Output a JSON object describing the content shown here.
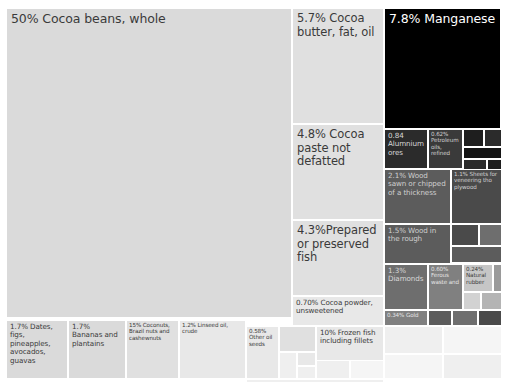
{
  "chart_data": {
    "type": "treemap",
    "title": "",
    "value_unit": "percent share",
    "background": "#ffffff",
    "gap_color": "#ffffff",
    "nodes": [
      {
        "name": "cocoa-beans-whole",
        "label": "50% Cocoa beans, whole",
        "value": 50,
        "x": 6,
        "y": 8,
        "w": 286,
        "h": 310,
        "tone": 13,
        "size": "xl"
      },
      {
        "name": "cocoa-butter-fat-oil",
        "label": "5.7% Cocoa butter, fat, oil",
        "value": 5.7,
        "x": 292,
        "y": 8,
        "w": 92,
        "h": 116,
        "tone": 14,
        "size": "lg"
      },
      {
        "name": "manganese",
        "label": "7.8% Manganese",
        "value": 7.8,
        "x": 384,
        "y": 8,
        "w": 117,
        "h": 121,
        "tone": 0,
        "size": "xl"
      },
      {
        "name": "cocoa-paste-not-defatted",
        "label": "4.8% Cocoa paste not defatted",
        "value": 4.8,
        "x": 292,
        "y": 124,
        "w": 92,
        "h": 96,
        "tone": 14,
        "size": "lg"
      },
      {
        "name": "prepared-or-preserved-fish",
        "label": "4.3%Prepared or preserved fish",
        "value": 4.3,
        "x": 292,
        "y": 220,
        "w": 92,
        "h": 76,
        "tone": 14,
        "size": "lg"
      },
      {
        "name": "cocoa-powder-unsweetened",
        "label": "0.70% Cocoa powder, unsweetened",
        "value": 0.7,
        "x": 292,
        "y": 296,
        "w": 92,
        "h": 30,
        "tone": 15,
        "size": "sm"
      },
      {
        "name": "aluminium-ores",
        "label": "0.84 Alumnium ores",
        "value": 0.84,
        "x": 384,
        "y": 129,
        "w": 44,
        "h": 40,
        "tone": 3,
        "size": "sm"
      },
      {
        "name": "petroleum-oils-refined",
        "label": "0.62% Petroleum oils, refined",
        "value": 0.62,
        "x": 428,
        "y": 129,
        "w": 35,
        "h": 40,
        "tone": 4,
        "size": "xs"
      },
      {
        "name": "small-dark-cell-a",
        "label": "",
        "value": 0.3,
        "x": 463,
        "y": 129,
        "w": 21,
        "h": 18,
        "tone": 2,
        "size": "xs"
      },
      {
        "name": "small-dark-cell-b",
        "label": "",
        "value": 0.28,
        "x": 484,
        "y": 129,
        "w": 18,
        "h": 18,
        "tone": 3,
        "size": "xs"
      },
      {
        "name": "small-dark-cell-c",
        "label": "",
        "value": 0.22,
        "x": 463,
        "y": 147,
        "w": 39,
        "h": 12,
        "tone": 1,
        "size": "xs"
      },
      {
        "name": "small-dark-cell-d",
        "label": "",
        "value": 0.18,
        "x": 463,
        "y": 159,
        "w": 24,
        "h": 11,
        "tone": 3,
        "size": "xs"
      },
      {
        "name": "small-dark-cell-e",
        "label": "",
        "value": 0.14,
        "x": 487,
        "y": 159,
        "w": 15,
        "h": 11,
        "tone": 2,
        "size": "xs"
      },
      {
        "name": "wood-sawn-or-chipped",
        "label": "2.1% Wood sawn or chipped of a thickness",
        "value": 2.1,
        "x": 384,
        "y": 169,
        "w": 67,
        "h": 55,
        "tone": 6,
        "size": "sm"
      },
      {
        "name": "sheets-for-veneering",
        "label": "1.1% Sheets for veneering tho plywood",
        "value": 1.1,
        "x": 451,
        "y": 169,
        "w": 51,
        "h": 55,
        "tone": 5,
        "size": "xs"
      },
      {
        "name": "wood-in-the-rough",
        "label": "1.5% Wood in the rough",
        "value": 1.5,
        "x": 384,
        "y": 224,
        "w": 67,
        "h": 40,
        "tone": 6,
        "size": "sm"
      },
      {
        "name": "right-mid-cell-a",
        "label": "",
        "value": 0.5,
        "x": 451,
        "y": 224,
        "w": 28,
        "h": 22,
        "tone": 5,
        "size": "xs"
      },
      {
        "name": "right-mid-cell-b",
        "label": "",
        "value": 0.4,
        "x": 479,
        "y": 224,
        "w": 23,
        "h": 22,
        "tone": 7,
        "size": "xs"
      },
      {
        "name": "right-mid-cell-c",
        "label": "",
        "value": 0.3,
        "x": 451,
        "y": 246,
        "w": 51,
        "h": 17,
        "tone": 6,
        "size": "xs"
      },
      {
        "name": "diamonds",
        "label": "1.3% Diamonds",
        "value": 1.3,
        "x": 384,
        "y": 264,
        "w": 44,
        "h": 46,
        "tone": 7,
        "size": "sm"
      },
      {
        "name": "ferous-waste-and",
        "label": "0.60% Ferous waste and",
        "value": 0.6,
        "x": 428,
        "y": 264,
        "w": 35,
        "h": 46,
        "tone": 8,
        "size": "xs"
      },
      {
        "name": "natural-rubber",
        "label": "0.24% Natural rubber",
        "value": 0.24,
        "x": 463,
        "y": 264,
        "w": 30,
        "h": 28,
        "tone": 11,
        "size": "xs"
      },
      {
        "name": "right-low-cell-a",
        "label": "",
        "value": 0.15,
        "x": 493,
        "y": 264,
        "w": 9,
        "h": 28,
        "tone": 9,
        "size": "xs"
      },
      {
        "name": "right-low-cell-b",
        "label": "",
        "value": 0.12,
        "x": 463,
        "y": 292,
        "w": 18,
        "h": 18,
        "tone": 12,
        "size": "xs"
      },
      {
        "name": "right-low-cell-c",
        "label": "",
        "value": 0.1,
        "x": 481,
        "y": 292,
        "w": 21,
        "h": 18,
        "tone": 10,
        "size": "xs"
      },
      {
        "name": "gold",
        "label": "0.34% Gold",
        "value": 0.34,
        "x": 384,
        "y": 310,
        "w": 44,
        "h": 16,
        "tone": 8,
        "size": "xs"
      },
      {
        "name": "bottom-right-cell-a",
        "label": "",
        "value": 0.2,
        "x": 428,
        "y": 310,
        "w": 24,
        "h": 16,
        "tone": 6,
        "size": "xs"
      },
      {
        "name": "bottom-right-cell-b",
        "label": "",
        "value": 0.16,
        "x": 452,
        "y": 310,
        "w": 26,
        "h": 16,
        "tone": 7,
        "size": "xs"
      },
      {
        "name": "bottom-right-cell-c",
        "label": "",
        "value": 0.12,
        "x": 478,
        "y": 310,
        "w": 24,
        "h": 16,
        "tone": 5,
        "size": "xs"
      },
      {
        "name": "dates-figs-pineapples",
        "label": "1.7% Dates, figs, pineapples, avocados, guavas",
        "value": 1.7,
        "x": 6,
        "y": 320,
        "w": 62,
        "h": 59,
        "tone": 13,
        "size": "sm"
      },
      {
        "name": "bananas-and-plantains",
        "label": "1.7% Bananas and plantains",
        "value": 1.7,
        "x": 68,
        "y": 320,
        "w": 58,
        "h": 59,
        "tone": 13,
        "size": "sm"
      },
      {
        "name": "coconuts-brazil-cashew",
        "label": "15% Coconuts, Brazil nuts and cashewnuts",
        "value": 1.5,
        "x": 126,
        "y": 320,
        "w": 53,
        "h": 59,
        "tone": 14,
        "size": "xs"
      },
      {
        "name": "linseed-oil-crude",
        "label": "1.2% Linseed oil, crude",
        "value": 1.2,
        "x": 179,
        "y": 320,
        "w": 67,
        "h": 59,
        "tone": 15,
        "size": "xs"
      },
      {
        "name": "other-oil-seeds",
        "label": "0.58% Other oil seeds",
        "value": 0.58,
        "x": 246,
        "y": 326,
        "w": 33,
        "h": 53,
        "tone": 15,
        "size": "xs"
      },
      {
        "name": "frozen-fish-including-fillets",
        "label": "10% Frozen fish including fillets",
        "value": 1.0,
        "x": 316,
        "y": 326,
        "w": 68,
        "h": 53,
        "tone": 15,
        "size": "sm"
      },
      {
        "name": "bottom-filler-a",
        "label": "",
        "value": 0.3,
        "x": 279,
        "y": 326,
        "w": 37,
        "h": 26,
        "tone": 14,
        "size": "xs"
      },
      {
        "name": "bottom-filler-b",
        "label": "",
        "value": 0.2,
        "x": 279,
        "y": 352,
        "w": 18,
        "h": 27,
        "tone": 16,
        "size": "xs"
      },
      {
        "name": "bottom-filler-c",
        "label": "",
        "value": 0.18,
        "x": 297,
        "y": 352,
        "w": 19,
        "h": 14,
        "tone": 15,
        "size": "xs"
      },
      {
        "name": "bottom-filler-d",
        "label": "",
        "value": 0.14,
        "x": 297,
        "y": 366,
        "w": 19,
        "h": 13,
        "tone": 16,
        "size": "xs"
      },
      {
        "name": "bottom-filler-e",
        "label": "",
        "value": 0.12,
        "x": 316,
        "y": 360,
        "w": 34,
        "h": 19,
        "tone": 16,
        "size": "xs"
      },
      {
        "name": "bottom-filler-f",
        "label": "",
        "value": 0.1,
        "x": 350,
        "y": 360,
        "w": 34,
        "h": 19,
        "tone": 17,
        "size": "xs"
      },
      {
        "name": "bottom-filler-g",
        "label": "",
        "value": 0.09,
        "x": 246,
        "y": 379,
        "w": 138,
        "h": 4,
        "tone": 16,
        "size": "xs"
      },
      {
        "name": "bottom-filler-h",
        "label": "",
        "value": 0.08,
        "x": 384,
        "y": 326,
        "w": 59,
        "h": 28,
        "tone": 16,
        "size": "xs"
      },
      {
        "name": "bottom-filler-i",
        "label": "",
        "value": 0.07,
        "x": 443,
        "y": 326,
        "w": 59,
        "h": 28,
        "tone": 17,
        "size": "xs"
      },
      {
        "name": "bottom-filler-j",
        "label": "",
        "value": 0.06,
        "x": 384,
        "y": 354,
        "w": 59,
        "h": 25,
        "tone": 17,
        "size": "xs"
      },
      {
        "name": "bottom-filler-k",
        "label": "",
        "value": 0.05,
        "x": 443,
        "y": 354,
        "w": 59,
        "h": 25,
        "tone": 16,
        "size": "xs"
      }
    ]
  }
}
